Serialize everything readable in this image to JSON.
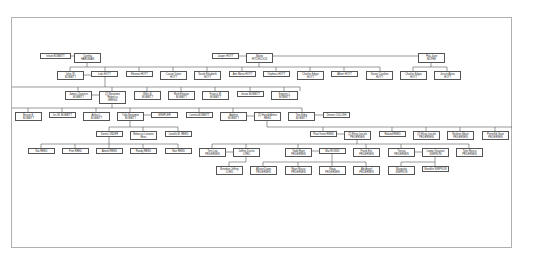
{
  "diagram": {
    "type": "family-tree",
    "nodes": [
      {
        "id": "n1",
        "line1": "Infant BOBBITT",
        "line2": "",
        "x": 40,
        "y": 53,
        "w": 31,
        "h": 6
      },
      {
        "id": "n2",
        "line1": "Cynthia",
        "line2": "HARDMAN",
        "x": 74,
        "y": 53,
        "w": 27,
        "h": 10
      },
      {
        "id": "n3",
        "line1": "Jasper HOYT",
        "line2": "",
        "x": 212,
        "y": 53,
        "w": 27,
        "h": 6
      },
      {
        "id": "n4",
        "line1": "Mattie",
        "line2": "HITCHCOCK",
        "x": 246,
        "y": 53,
        "w": 27,
        "h": 10
      },
      {
        "id": "n5",
        "line1": "Pilia Jane",
        "line2": "MCFEE",
        "x": 418,
        "y": 53,
        "w": 27,
        "h": 10
      },
      {
        "id": "n6",
        "line1": "John W.",
        "line2": "BOBBITT",
        "x": 57,
        "y": 71,
        "w": 27,
        "h": 9
      },
      {
        "id": "n7",
        "line1": "Lola HOYT",
        "line2": "",
        "x": 91,
        "y": 71,
        "w": 27,
        "h": 6
      },
      {
        "id": "n8",
        "line1": "Eleanor HOYT",
        "line2": "",
        "x": 126,
        "y": 71,
        "w": 27,
        "h": 6
      },
      {
        "id": "n9",
        "line1": "Cassie Dovie",
        "line2": "HOYT",
        "x": 160,
        "y": 71,
        "w": 27,
        "h": 9
      },
      {
        "id": "n10",
        "line1": "Sarah Elizabeth",
        "line2": "HOYT",
        "x": 194,
        "y": 71,
        "w": 27,
        "h": 9
      },
      {
        "id": "n11",
        "line1": "Ann Maria HOYT",
        "line2": "",
        "x": 229,
        "y": 71,
        "w": 27,
        "h": 6
      },
      {
        "id": "n12",
        "line1": "Orpheus HOYT",
        "line2": "",
        "x": 263,
        "y": 71,
        "w": 27,
        "h": 6
      },
      {
        "id": "n13",
        "line1": "Charles Edgar",
        "line2": "HOYT",
        "x": 297,
        "y": 71,
        "w": 27,
        "h": 9
      },
      {
        "id": "n14",
        "line1": "Albert HOYT",
        "line2": "",
        "x": 331,
        "y": 71,
        "w": 27,
        "h": 6
      },
      {
        "id": "n15",
        "line1": "Susan Caroline",
        "line2": "HOYT",
        "x": 366,
        "y": 71,
        "w": 27,
        "h": 9
      },
      {
        "id": "n16",
        "line1": "Charles Edgar",
        "line2": "HOYT",
        "x": 400,
        "y": 71,
        "w": 27,
        "h": 9
      },
      {
        "id": "n17",
        "line1": "Jessie Alvira",
        "line2": "HOYT",
        "x": 434,
        "y": 71,
        "w": 27,
        "h": 9
      },
      {
        "id": "n18",
        "line1": "James Clarence",
        "line2": "BOBBITT",
        "x": 65,
        "y": 91,
        "w": 27,
        "h": 9
      },
      {
        "id": "n19",
        "line1": "(2) Benjamin",
        "line2": "Rebecca",
        "line3": "GREGG",
        "x": 99,
        "y": 91,
        "w": 27,
        "h": 13
      },
      {
        "id": "n20",
        "line1": "Willis B.",
        "line2": "BOBBITT",
        "x": 134,
        "y": 91,
        "w": 27,
        "h": 9
      },
      {
        "id": "n21",
        "line1": "Ruth Eleanor",
        "line2": "BOBBITT",
        "x": 168,
        "y": 91,
        "w": 27,
        "h": 9
      },
      {
        "id": "n22",
        "line1": "Francis M.",
        "line2": "BOBBITT",
        "x": 202,
        "y": 91,
        "w": 27,
        "h": 9
      },
      {
        "id": "n23",
        "line1": "Jessie BOBBITT",
        "line2": "",
        "x": 237,
        "y": 91,
        "w": 27,
        "h": 6
      },
      {
        "id": "n24",
        "line1": "Eugene J.",
        "line2": "BOBBITT",
        "x": 271,
        "y": 91,
        "w": 27,
        "h": 9
      },
      {
        "id": "n25",
        "line1": "Bessie E.",
        "line2": "BOBBITT",
        "x": 15,
        "y": 112,
        "w": 27,
        "h": 9
      },
      {
        "id": "n26",
        "line1": "Iris W. BOBBITT",
        "line2": "",
        "x": 49,
        "y": 112,
        "w": 27,
        "h": 6
      },
      {
        "id": "n27",
        "line1": "Arthur L.",
        "line2": "BOBBITT",
        "x": 83,
        "y": 112,
        "w": 27,
        "h": 9
      },
      {
        "id": "n28",
        "line1": "Tulla Benjamin",
        "line2": "BOBBITT",
        "x": 117,
        "y": 112,
        "w": 27,
        "h": 9
      },
      {
        "id": "n29",
        "line1": "MINIPLER",
        "line2": "",
        "x": 151,
        "y": 112,
        "w": 27,
        "h": 6
      },
      {
        "id": "n30",
        "line1": "Loretta BOBBITT",
        "line2": "",
        "x": 186,
        "y": 112,
        "w": 27,
        "h": 6
      },
      {
        "id": "n31",
        "line1": "Adaline",
        "line2": "BOBBITT",
        "x": 220,
        "y": 112,
        "w": 27,
        "h": 9
      },
      {
        "id": "n32",
        "line1": "(2) Harold Arthur",
        "line2": "REED",
        "x": 254,
        "y": 112,
        "w": 27,
        "h": 9
      },
      {
        "id": "n33",
        "line1": "Toni Edna",
        "line2": "BOBBITT",
        "x": 288,
        "y": 112,
        "w": 27,
        "h": 9
      },
      {
        "id": "n34",
        "line1": "Dennis CULLISH",
        "line2": "",
        "x": 323,
        "y": 112,
        "w": 27,
        "h": 6
      },
      {
        "id": "n35",
        "line1": "Derek LINDER",
        "line2": "",
        "x": 96,
        "y": 131,
        "w": 27,
        "h": 6
      },
      {
        "id": "n36",
        "line1": "Rebecca Lorraine",
        "line2": "Rees",
        "x": 130,
        "y": 131,
        "w": 27,
        "h": 9
      },
      {
        "id": "n37",
        "line1": "Lovelle M. REED",
        "line2": "",
        "x": 165,
        "y": 131,
        "w": 27,
        "h": 6
      },
      {
        "id": "n38",
        "line1": "Pearl Irene REED",
        "line2": "",
        "x": 310,
        "y": 131,
        "w": 27,
        "h": 6
      },
      {
        "id": "n39",
        "line1": "(2) Elroy Lincoln",
        "line2": "PEDERSEN",
        "x": 344,
        "y": 131,
        "w": 27,
        "h": 9
      },
      {
        "id": "n40",
        "line1": "Roland REED",
        "line2": "",
        "x": 379,
        "y": 131,
        "w": 27,
        "h": 6
      },
      {
        "id": "n41",
        "line1": "(2) Elroy Lincoln",
        "line2": "PEDERSEN",
        "x": 413,
        "y": 131,
        "w": 27,
        "h": 9
      },
      {
        "id": "n42",
        "line1": "Nerlene Marie",
        "line2": "PEDERSEN",
        "x": 447,
        "y": 131,
        "w": 27,
        "h": 9
      },
      {
        "id": "n43",
        "line1": "Pernelldi Sean",
        "line2": "PEDERSEN",
        "x": 482,
        "y": 131,
        "w": 27,
        "h": 9
      },
      {
        "id": "n44",
        "line1": "Nia REED",
        "line2": "",
        "x": 28,
        "y": 148,
        "w": 27,
        "h": 6
      },
      {
        "id": "n45",
        "line1": "Finn REED",
        "line2": "",
        "x": 62,
        "y": 148,
        "w": 27,
        "h": 6
      },
      {
        "id": "n46",
        "line1": "Abrahl REED",
        "line2": "",
        "x": 96,
        "y": 148,
        "w": 27,
        "h": 6
      },
      {
        "id": "n47",
        "line1": "Randy REED",
        "line2": "",
        "x": 130,
        "y": 148,
        "w": 27,
        "h": 6
      },
      {
        "id": "n48",
        "line1": "Noe REED",
        "line2": "",
        "x": 165,
        "y": 148,
        "w": 27,
        "h": 6
      },
      {
        "id": "n49",
        "line1": "Terri Lea",
        "line2": "PEDERSEN",
        "x": 199,
        "y": 148,
        "w": 27,
        "h": 9
      },
      {
        "id": "n50",
        "line1": "Jeffrey Dustin",
        "line2": "LORD",
        "x": 233,
        "y": 148,
        "w": 27,
        "h": 9
      },
      {
        "id": "n51",
        "line1": "Todd Ryan",
        "line2": "PEDERSEN",
        "x": 285,
        "y": 148,
        "w": 27,
        "h": 9
      },
      {
        "id": "n52",
        "line1": "Mia ROSSO",
        "line2": "",
        "x": 319,
        "y": 148,
        "w": 27,
        "h": 6
      },
      {
        "id": "n53",
        "line1": "Frank Eric",
        "line2": "PEDERSEN",
        "x": 353,
        "y": 148,
        "w": 27,
        "h": 9
      },
      {
        "id": "n54",
        "line1": "Teresa",
        "line2": "PEDERSEN",
        "x": 388,
        "y": 148,
        "w": 27,
        "h": 9
      },
      {
        "id": "n55",
        "line1": "Lamar Grayson",
        "line2": "SIMPSON",
        "x": 422,
        "y": 148,
        "w": 27,
        "h": 9
      },
      {
        "id": "n56",
        "line1": "Tyler Rasco",
        "line2": "PEDERSEN",
        "x": 456,
        "y": 148,
        "w": 27,
        "h": 9
      },
      {
        "id": "n57",
        "line1": "Brendan Jeffrey",
        "line2": "LORD",
        "x": 216,
        "y": 166,
        "w": 27,
        "h": 9
      },
      {
        "id": "n58",
        "line1": "Allison Dawn",
        "line2": "PEDERSEN",
        "x": 250,
        "y": 166,
        "w": 27,
        "h": 9
      },
      {
        "id": "n59",
        "line1": "Ryan Rusco",
        "line2": "PEDERSEN",
        "x": 285,
        "y": 166,
        "w": 27,
        "h": 9
      },
      {
        "id": "n60",
        "line1": "Khaia",
        "line2": "PEDERSEN",
        "x": 319,
        "y": 166,
        "w": 27,
        "h": 9
      },
      {
        "id": "n61",
        "line1": "Abi Angel",
        "line2": "PEDERSEN",
        "x": 353,
        "y": 166,
        "w": 27,
        "h": 9
      },
      {
        "id": "n62",
        "line1": "Marquitta",
        "line2": "SIMPSON",
        "x": 388,
        "y": 166,
        "w": 27,
        "h": 9
      },
      {
        "id": "n63",
        "line1": "Brooklin SIMPSON",
        "line2": "",
        "x": 422,
        "y": 166,
        "w": 27,
        "h": 6
      }
    ]
  }
}
